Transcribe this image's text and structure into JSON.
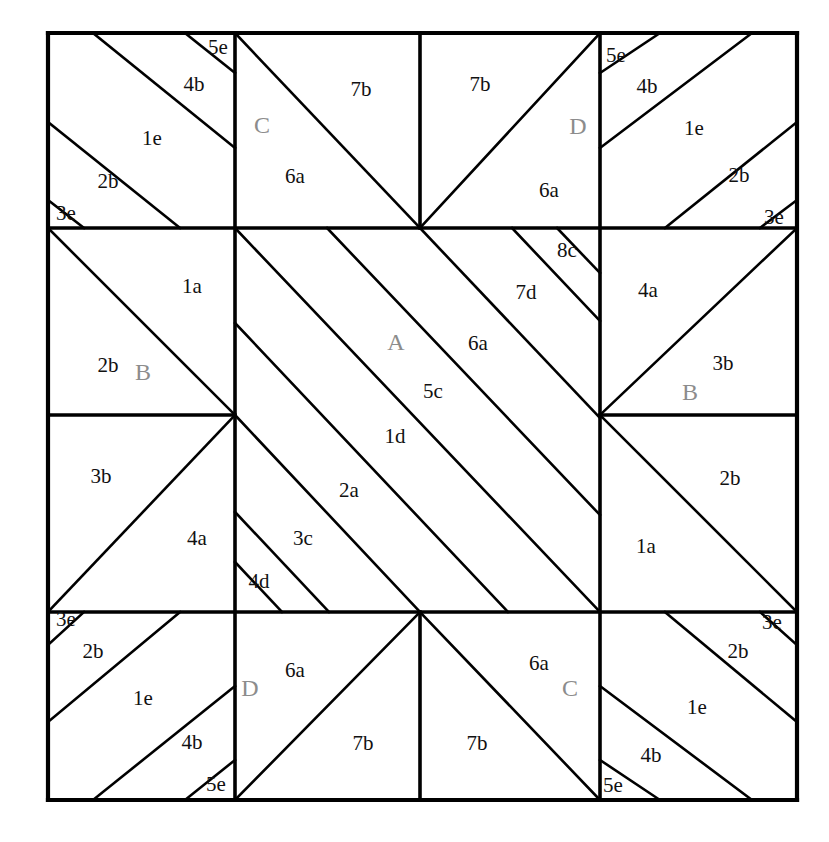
{
  "figure": {
    "kind": "patchwork-quilt-block-diagram",
    "background_color": "#ffffff",
    "line_color": "#000000",
    "patch_label_color": "#111111",
    "block_label_color": "#8c8c8c",
    "outer_frame": {
      "x": 48,
      "y": 33,
      "width": 749,
      "height": 767
    },
    "grid": {
      "vertical_lines": [
        48,
        235,
        420,
        600,
        797
      ],
      "horizontal_lines": [
        33,
        228,
        415,
        612,
        800
      ]
    }
  },
  "block_labels": [
    {
      "id": "block-c-top",
      "text": "C",
      "x": 262,
      "y": 127
    },
    {
      "id": "block-d-top",
      "text": "D",
      "x": 578,
      "y": 128
    },
    {
      "id": "block-b-left",
      "text": "B",
      "x": 143,
      "y": 374
    },
    {
      "id": "block-a-center",
      "text": "A",
      "x": 396,
      "y": 344
    },
    {
      "id": "block-b-right",
      "text": "B",
      "x": 690,
      "y": 394
    },
    {
      "id": "block-d-bottom",
      "text": "D",
      "x": 250,
      "y": 690
    },
    {
      "id": "block-c-bottom",
      "text": "C",
      "x": 570,
      "y": 690
    }
  ],
  "patch_labels": [
    {
      "id": "tl-5e",
      "text": "5e",
      "x": 218,
      "y": 49
    },
    {
      "id": "tl-4b",
      "text": "4b",
      "x": 194,
      "y": 86
    },
    {
      "id": "tl-1e",
      "text": "1e",
      "x": 152,
      "y": 140
    },
    {
      "id": "tl-2b",
      "text": "2b",
      "x": 108,
      "y": 183
    },
    {
      "id": "tl-3e",
      "text": "3e",
      "x": 66,
      "y": 215
    },
    {
      "id": "tc-7b",
      "text": "7b",
      "x": 361,
      "y": 91
    },
    {
      "id": "tc-6a",
      "text": "6a",
      "x": 295,
      "y": 178
    },
    {
      "id": "tr2-7b",
      "text": "7b",
      "x": 480,
      "y": 86
    },
    {
      "id": "tr2-6a",
      "text": "6a",
      "x": 549,
      "y": 192
    },
    {
      "id": "tr-5e",
      "text": "5e",
      "x": 616,
      "y": 57
    },
    {
      "id": "tr-4b",
      "text": "4b",
      "x": 647,
      "y": 88
    },
    {
      "id": "tr-1e",
      "text": "1e",
      "x": 694,
      "y": 130
    },
    {
      "id": "tr-2b",
      "text": "2b",
      "x": 739,
      "y": 177
    },
    {
      "id": "tr-3e",
      "text": "3e",
      "x": 774,
      "y": 219
    },
    {
      "id": "ml-1a",
      "text": "1a",
      "x": 192,
      "y": 288
    },
    {
      "id": "ml-2b",
      "text": "2b",
      "x": 108,
      "y": 367
    },
    {
      "id": "ml-3b",
      "text": "3b",
      "x": 101,
      "y": 478
    },
    {
      "id": "ml-4a",
      "text": "4a",
      "x": 197,
      "y": 540
    },
    {
      "id": "c-8c",
      "text": "8c",
      "x": 567,
      "y": 252
    },
    {
      "id": "c-7d",
      "text": "7d",
      "x": 526,
      "y": 294
    },
    {
      "id": "c-6a",
      "text": "6a",
      "x": 478,
      "y": 345
    },
    {
      "id": "c-5c",
      "text": "5c",
      "x": 433,
      "y": 393
    },
    {
      "id": "c-1d",
      "text": "1d",
      "x": 395,
      "y": 438
    },
    {
      "id": "c-2a",
      "text": "2a",
      "x": 349,
      "y": 492
    },
    {
      "id": "c-3c",
      "text": "3c",
      "x": 303,
      "y": 540
    },
    {
      "id": "c-4d",
      "text": "4d",
      "x": 259,
      "y": 583
    },
    {
      "id": "mr-4a",
      "text": "4a",
      "x": 648,
      "y": 292
    },
    {
      "id": "mr-3b",
      "text": "3b",
      "x": 723,
      "y": 365
    },
    {
      "id": "mr-2b",
      "text": "2b",
      "x": 730,
      "y": 480
    },
    {
      "id": "mr-1a",
      "text": "1a",
      "x": 646,
      "y": 548
    },
    {
      "id": "bl-3e",
      "text": "3e",
      "x": 66,
      "y": 621
    },
    {
      "id": "bl-2b",
      "text": "2b",
      "x": 93,
      "y": 653
    },
    {
      "id": "bl-1e",
      "text": "1e",
      "x": 143,
      "y": 700
    },
    {
      "id": "bl-4b",
      "text": "4b",
      "x": 192,
      "y": 744
    },
    {
      "id": "bl-5e",
      "text": "5e",
      "x": 216,
      "y": 786
    },
    {
      "id": "bc-6a",
      "text": "6a",
      "x": 295,
      "y": 672
    },
    {
      "id": "bc-7b",
      "text": "7b",
      "x": 363,
      "y": 745
    },
    {
      "id": "br2-7b",
      "text": "7b",
      "x": 477,
      "y": 745
    },
    {
      "id": "br2-6a",
      "text": "6a",
      "x": 539,
      "y": 665
    },
    {
      "id": "br-3e",
      "text": "3e",
      "x": 772,
      "y": 624
    },
    {
      "id": "br-2b",
      "text": "2b",
      "x": 738,
      "y": 653
    },
    {
      "id": "br-1e",
      "text": "1e",
      "x": 697,
      "y": 709
    },
    {
      "id": "br-4b",
      "text": "4b",
      "x": 651,
      "y": 757
    },
    {
      "id": "br-5e",
      "text": "5e",
      "x": 613,
      "y": 787
    }
  ],
  "frame_lines": [
    {
      "id": "frame-top",
      "x1": 48,
      "y1": 33,
      "x2": 797,
      "y2": 33
    },
    {
      "id": "frame-right",
      "x1": 797,
      "y1": 33,
      "x2": 797,
      "y2": 800
    },
    {
      "id": "frame-bottom",
      "x1": 48,
      "y1": 800,
      "x2": 797,
      "y2": 800
    },
    {
      "id": "frame-left",
      "x1": 48,
      "y1": 33,
      "x2": 48,
      "y2": 800
    }
  ],
  "major_lines": [
    {
      "id": "h-upper",
      "x1": 48,
      "y1": 228,
      "x2": 797,
      "y2": 228
    },
    {
      "id": "h-lower",
      "x1": 48,
      "y1": 612,
      "x2": 797,
      "y2": 612
    },
    {
      "id": "v-left",
      "x1": 235,
      "y1": 33,
      "x2": 235,
      "y2": 800
    },
    {
      "id": "v-right",
      "x1": 600,
      "y1": 33,
      "x2": 600,
      "y2": 800
    },
    {
      "id": "v-center-top",
      "x1": 420,
      "y1": 33,
      "x2": 420,
      "y2": 228
    },
    {
      "id": "v-center-bottom",
      "x1": 420,
      "y1": 612,
      "x2": 420,
      "y2": 800
    },
    {
      "id": "h-mid-left",
      "x1": 48,
      "y1": 415,
      "x2": 235,
      "y2": 415
    },
    {
      "id": "h-mid-right",
      "x1": 600,
      "y1": 415,
      "x2": 797,
      "y2": 415
    }
  ],
  "diagonal_lines": [
    {
      "id": "tl-d1",
      "x1": 48,
      "y1": 200,
      "x2": 84,
      "y2": 228
    },
    {
      "id": "tl-d2",
      "x1": 48,
      "y1": 122,
      "x2": 180,
      "y2": 228
    },
    {
      "id": "tl-d3",
      "x1": 93,
      "y1": 33,
      "x2": 235,
      "y2": 148
    },
    {
      "id": "tl-d4",
      "x1": 185,
      "y1": 33,
      "x2": 235,
      "y2": 73
    },
    {
      "id": "tc-d1",
      "x1": 235,
      "y1": 33,
      "x2": 420,
      "y2": 228
    },
    {
      "id": "tr2-d1",
      "x1": 600,
      "y1": 33,
      "x2": 420,
      "y2": 228
    },
    {
      "id": "tr-d1",
      "x1": 797,
      "y1": 200,
      "x2": 760,
      "y2": 228
    },
    {
      "id": "tr-d2",
      "x1": 797,
      "y1": 122,
      "x2": 665,
      "y2": 228
    },
    {
      "id": "tr-d3",
      "x1": 752,
      "y1": 33,
      "x2": 600,
      "y2": 148
    },
    {
      "id": "tr-d4",
      "x1": 660,
      "y1": 33,
      "x2": 600,
      "y2": 73
    },
    {
      "id": "ml-d1",
      "x1": 48,
      "y1": 228,
      "x2": 235,
      "y2": 415
    },
    {
      "id": "ml-d2",
      "x1": 48,
      "y1": 612,
      "x2": 235,
      "y2": 415
    },
    {
      "id": "mr-d1",
      "x1": 797,
      "y1": 228,
      "x2": 600,
      "y2": 415
    },
    {
      "id": "mr-d2",
      "x1": 797,
      "y1": 612,
      "x2": 600,
      "y2": 415
    },
    {
      "id": "ca-d1",
      "x1": 235,
      "y1": 228,
      "x2": 600,
      "y2": 612
    },
    {
      "id": "ca-d2",
      "x1": 235,
      "y1": 323,
      "x2": 508,
      "y2": 612
    },
    {
      "id": "ca-d3",
      "x1": 235,
      "y1": 415,
      "x2": 420,
      "y2": 612
    },
    {
      "id": "ca-d4",
      "x1": 235,
      "y1": 512,
      "x2": 329,
      "y2": 612
    },
    {
      "id": "ca-d5",
      "x1": 235,
      "y1": 562,
      "x2": 282,
      "y2": 612
    },
    {
      "id": "ca-d6",
      "x1": 327,
      "y1": 228,
      "x2": 600,
      "y2": 515
    },
    {
      "id": "ca-d7",
      "x1": 420,
      "y1": 228,
      "x2": 600,
      "y2": 418
    },
    {
      "id": "ca-d8",
      "x1": 512,
      "y1": 228,
      "x2": 600,
      "y2": 321
    },
    {
      "id": "ca-d9",
      "x1": 557,
      "y1": 228,
      "x2": 600,
      "y2": 273
    },
    {
      "id": "bl-d1",
      "x1": 48,
      "y1": 645,
      "x2": 84,
      "y2": 612
    },
    {
      "id": "bl-d2",
      "x1": 48,
      "y1": 722,
      "x2": 180,
      "y2": 612
    },
    {
      "id": "bl-d3",
      "x1": 93,
      "y1": 800,
      "x2": 235,
      "y2": 686
    },
    {
      "id": "bl-d4",
      "x1": 185,
      "y1": 800,
      "x2": 235,
      "y2": 760
    },
    {
      "id": "bc-d1",
      "x1": 235,
      "y1": 800,
      "x2": 420,
      "y2": 612
    },
    {
      "id": "br2-d1",
      "x1": 600,
      "y1": 800,
      "x2": 420,
      "y2": 612
    },
    {
      "id": "br-d1",
      "x1": 797,
      "y1": 645,
      "x2": 760,
      "y2": 612
    },
    {
      "id": "br-d2",
      "x1": 797,
      "y1": 722,
      "x2": 665,
      "y2": 612
    },
    {
      "id": "br-d3",
      "x1": 752,
      "y1": 800,
      "x2": 600,
      "y2": 686
    },
    {
      "id": "br-d4",
      "x1": 660,
      "y1": 800,
      "x2": 600,
      "y2": 760
    }
  ]
}
